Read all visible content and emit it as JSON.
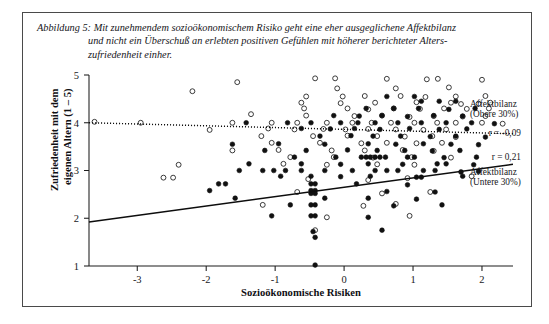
{
  "figure": {
    "caption_label": "Abbildung 5:",
    "caption_line_1": "Abbildung 5: Mit zunehmendem sozioökonomischem Risiko geht eine eher ausgeglichene Affektbilanz",
    "caption_line_2": "und nicht ein Überschuß an erlebten positiven Gefühlen mit höherer berichteter Alters-",
    "caption_line_3": "zufriedenheit einher."
  },
  "chart_data": {
    "type": "scatter",
    "title": "",
    "xlabel": "Sozioökonomische Risiken",
    "ylabel": "Zufriedenheit mit dem eigenen Altern (1 – 5)",
    "ylabel_line_1": "Zufriedenheit mit dem",
    "ylabel_line_2": "eigenen Altern (1 – 5)",
    "xlim": [
      -3.7,
      2.45
    ],
    "ylim": [
      1,
      5
    ],
    "xticks": [
      -3,
      -2,
      -1,
      0,
      1,
      2
    ],
    "xticklabels": [
      "-3",
      "-2",
      "-1",
      "0",
      "1",
      "2"
    ],
    "yticks": [
      1,
      2,
      3,
      4,
      5
    ],
    "yticklabels": [
      "1",
      "2",
      "3",
      "4",
      "5"
    ],
    "grid": false,
    "legend_position": "right",
    "series": [
      {
        "name": "Affektbilanz (Obere 30%)",
        "name_line_1": "Affektbilanz",
        "name_line_2": "(Obere 30%)",
        "marker": "open-circle",
        "correlation_label": "r = -0,09",
        "correlation": -0.09,
        "trendline": {
          "style": "dotted",
          "x0": -3.7,
          "y0": 4.0,
          "x1": 2.45,
          "y1": 3.77
        },
        "points": [
          [
            -1.55,
            4.85
          ],
          [
            -0.42,
            4.93
          ],
          [
            -0.13,
            4.93
          ],
          [
            0.62,
            4.92
          ],
          [
            1.2,
            4.91
          ],
          [
            1.36,
            4.92
          ],
          [
            2.0,
            4.9
          ],
          [
            -0.1,
            4.72
          ],
          [
            0.75,
            4.72
          ],
          [
            1.52,
            4.74
          ],
          [
            -2.2,
            4.66
          ],
          [
            -0.55,
            4.55
          ],
          [
            -0.02,
            4.55
          ],
          [
            0.3,
            4.56
          ],
          [
            0.82,
            4.56
          ],
          [
            1.18,
            4.54
          ],
          [
            1.62,
            4.55
          ],
          [
            2.05,
            4.56
          ],
          [
            -0.62,
            4.42
          ],
          [
            -0.05,
            4.41
          ],
          [
            0.45,
            4.42
          ],
          [
            1.05,
            4.43
          ],
          [
            1.55,
            4.42
          ],
          [
            1.95,
            4.4
          ],
          [
            2.12,
            4.42
          ],
          [
            -0.58,
            4.3
          ],
          [
            0.05,
            4.3
          ],
          [
            0.35,
            4.28
          ],
          [
            0.72,
            4.3
          ],
          [
            1.1,
            4.29
          ],
          [
            1.45,
            4.3
          ],
          [
            1.78,
            4.29
          ],
          [
            2.1,
            4.3
          ],
          [
            -3.62,
            4.02
          ],
          [
            -1.35,
            4.18
          ],
          [
            -0.55,
            4.15
          ],
          [
            0.15,
            4.14
          ],
          [
            0.55,
            4.15
          ],
          [
            0.95,
            4.12
          ],
          [
            1.3,
            4.14
          ],
          [
            1.72,
            4.13
          ],
          [
            2.05,
            4.14
          ],
          [
            -2.95,
            4.0
          ],
          [
            -1.62,
            4.0
          ],
          [
            -1.05,
            4.0
          ],
          [
            -0.68,
            4.0
          ],
          [
            -0.25,
            4.0
          ],
          [
            0.12,
            4.0
          ],
          [
            0.4,
            4.0
          ],
          [
            0.68,
            4.0
          ],
          [
            1.02,
            4.0
          ],
          [
            1.35,
            4.0
          ],
          [
            1.62,
            4.0
          ],
          [
            2.0,
            4.0
          ],
          [
            2.3,
            3.98
          ],
          [
            -1.95,
            3.85
          ],
          [
            -1.1,
            3.88
          ],
          [
            -0.72,
            3.86
          ],
          [
            -0.3,
            3.87
          ],
          [
            0.02,
            3.86
          ],
          [
            0.35,
            3.87
          ],
          [
            0.75,
            3.86
          ],
          [
            1.15,
            3.85
          ],
          [
            1.48,
            3.86
          ],
          [
            -1.2,
            3.72
          ],
          [
            -0.45,
            3.72
          ],
          [
            0.05,
            3.73
          ],
          [
            0.48,
            3.72
          ],
          [
            0.88,
            3.71
          ],
          [
            1.28,
            3.72
          ],
          [
            1.62,
            3.7
          ],
          [
            -1.05,
            3.58
          ],
          [
            -0.35,
            3.58
          ],
          [
            0.25,
            3.57
          ],
          [
            0.62,
            3.58
          ],
          [
            1.05,
            3.57
          ],
          [
            1.42,
            3.58
          ],
          [
            -1.62,
            3.42
          ],
          [
            -0.95,
            3.43
          ],
          [
            -0.18,
            3.42
          ],
          [
            0.3,
            3.42
          ],
          [
            0.85,
            3.43
          ],
          [
            1.3,
            3.41
          ],
          [
            -0.78,
            3.28
          ],
          [
            -0.15,
            3.28
          ],
          [
            0.42,
            3.27
          ],
          [
            0.98,
            3.28
          ],
          [
            1.55,
            3.27
          ],
          [
            -2.4,
            3.12
          ],
          [
            -0.88,
            3.14
          ],
          [
            -0.25,
            3.12
          ],
          [
            0.48,
            3.13
          ],
          [
            1.02,
            3.12
          ],
          [
            -2.62,
            2.85
          ],
          [
            -2.48,
            2.85
          ],
          [
            -0.52,
            2.82
          ],
          [
            0.35,
            2.8
          ],
          [
            0.92,
            2.84
          ],
          [
            1.85,
            2.88
          ],
          [
            -0.68,
            2.55
          ],
          [
            0.55,
            2.52
          ],
          [
            1.25,
            2.55
          ],
          [
            -1.18,
            2.28
          ],
          [
            0.28,
            2.26
          ],
          [
            0.75,
            2.3
          ],
          [
            -0.25,
            2.02
          ],
          [
            0.95,
            2.05
          ],
          [
            -0.42,
            1.75
          ]
        ]
      },
      {
        "name": "Affektbilanz (Untere 30%)",
        "name_line_1": "Affektbilanz",
        "name_line_2": "(Untere 30%)",
        "marker": "filled-circle",
        "correlation_label": "r = 0,21",
        "correlation": 0.21,
        "trendline": {
          "style": "solid",
          "x0": -3.7,
          "y0": 1.92,
          "x1": 2.45,
          "y1": 3.13
        },
        "points": [
          [
            1.12,
            4.45
          ],
          [
            1.38,
            4.45
          ],
          [
            1.62,
            4.45
          ],
          [
            0.62,
            4.55
          ],
          [
            1.02,
            4.55
          ],
          [
            0.32,
            4.3
          ],
          [
            0.72,
            4.3
          ],
          [
            1.08,
            4.3
          ],
          [
            1.52,
            4.28
          ],
          [
            1.9,
            4.3
          ],
          [
            -0.15,
            4.15
          ],
          [
            0.22,
            4.14
          ],
          [
            0.55,
            4.15
          ],
          [
            0.92,
            4.13
          ],
          [
            1.3,
            4.15
          ],
          [
            1.72,
            4.14
          ],
          [
            -1.42,
            4.0
          ],
          [
            -0.82,
            4.0
          ],
          [
            -0.48,
            4.0
          ],
          [
            -0.05,
            4.0
          ],
          [
            0.2,
            4.0
          ],
          [
            0.45,
            4.0
          ],
          [
            0.78,
            4.0
          ],
          [
            1.12,
            4.0
          ],
          [
            1.48,
            4.0
          ],
          [
            1.85,
            4.0
          ],
          [
            2.18,
            3.98
          ],
          [
            -0.62,
            3.88
          ],
          [
            -0.2,
            3.87
          ],
          [
            0.15,
            3.88
          ],
          [
            0.52,
            3.86
          ],
          [
            0.95,
            3.88
          ],
          [
            1.38,
            3.86
          ],
          [
            1.78,
            3.87
          ],
          [
            -0.35,
            3.72
          ],
          [
            0.1,
            3.73
          ],
          [
            0.42,
            3.72
          ],
          [
            0.82,
            3.72
          ],
          [
            1.25,
            3.71
          ],
          [
            1.62,
            3.72
          ],
          [
            2.05,
            3.7
          ],
          [
            -1.62,
            3.55
          ],
          [
            -0.95,
            3.56
          ],
          [
            -0.28,
            3.55
          ],
          [
            0.35,
            3.56
          ],
          [
            0.75,
            3.55
          ],
          [
            1.15,
            3.56
          ],
          [
            1.55,
            3.55
          ],
          [
            1.95,
            3.54
          ],
          [
            -1.15,
            3.42
          ],
          [
            -0.55,
            3.42
          ],
          [
            0.05,
            3.43
          ],
          [
            0.48,
            3.42
          ],
          [
            0.88,
            3.42
          ],
          [
            1.28,
            3.41
          ],
          [
            1.68,
            3.42
          ],
          [
            -0.72,
            3.28
          ],
          [
            -0.12,
            3.28
          ],
          [
            0.25,
            3.28
          ],
          [
            0.32,
            3.28
          ],
          [
            0.38,
            3.28
          ],
          [
            0.45,
            3.28
          ],
          [
            0.52,
            3.28
          ],
          [
            0.6,
            3.28
          ],
          [
            0.92,
            3.28
          ],
          [
            1.02,
            3.28
          ],
          [
            1.45,
            3.27
          ],
          [
            1.92,
            3.28
          ],
          [
            -1.38,
            3.14
          ],
          [
            -0.62,
            3.14
          ],
          [
            -0.05,
            3.13
          ],
          [
            0.35,
            3.14
          ],
          [
            0.85,
            3.13
          ],
          [
            1.35,
            3.14
          ],
          [
            1.48,
            3.14
          ],
          [
            1.88,
            3.12
          ],
          [
            -1.52,
            3.0
          ],
          [
            -1.18,
            3.0
          ],
          [
            -1.02,
            3.0
          ],
          [
            -0.85,
            3.0
          ],
          [
            -0.62,
            3.0
          ],
          [
            -0.28,
            3.0
          ],
          [
            0.12,
            3.0
          ],
          [
            0.45,
            3.0
          ],
          [
            0.62,
            3.0
          ],
          [
            0.78,
            3.0
          ],
          [
            1.15,
            3.0
          ],
          [
            1.32,
            3.0
          ],
          [
            1.95,
            2.98
          ],
          [
            -0.92,
            2.88
          ],
          [
            -0.48,
            2.88
          ],
          [
            -0.05,
            2.87
          ],
          [
            0.38,
            2.88
          ],
          [
            1.05,
            2.86
          ],
          [
            1.12,
            2.86
          ],
          [
            1.72,
            2.88
          ],
          [
            -1.82,
            2.72
          ],
          [
            -0.48,
            2.72
          ],
          [
            -0.42,
            2.72
          ],
          [
            0.18,
            2.72
          ],
          [
            0.92,
            2.7
          ],
          [
            -1.95,
            2.58
          ],
          [
            -0.48,
            2.58
          ],
          [
            -0.42,
            2.58
          ],
          [
            -0.48,
            2.52
          ],
          [
            -0.42,
            2.52
          ],
          [
            0.62,
            2.56
          ],
          [
            1.32,
            2.55
          ],
          [
            -0.28,
            2.42
          ],
          [
            0.35,
            2.42
          ],
          [
            1.05,
            2.4
          ],
          [
            -0.78,
            2.28
          ],
          [
            -0.48,
            2.28
          ],
          [
            -0.42,
            2.28
          ],
          [
            0.72,
            2.26
          ],
          [
            1.42,
            2.28
          ],
          [
            -1.05,
            2.05
          ],
          [
            -0.48,
            2.05
          ],
          [
            -0.42,
            2.05
          ],
          [
            0.35,
            2.02
          ],
          [
            -0.45,
            1.72
          ],
          [
            -0.42,
            1.6
          ],
          [
            0.55,
            1.75
          ],
          [
            -0.42,
            1.02
          ],
          [
            -1.72,
            2.72
          ],
          [
            -1.58,
            2.42
          ]
        ]
      }
    ]
  },
  "legend": {
    "upper_marker_name": "open-circle-marker",
    "lower_marker_name": "filled-circle-marker"
  }
}
